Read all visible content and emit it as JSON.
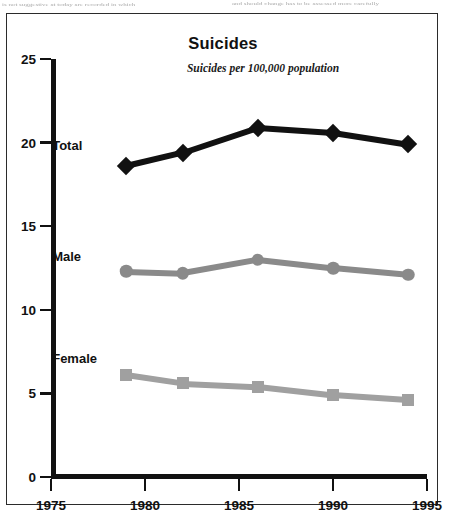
{
  "scan_text": {
    "left_fragment": "is not suggestive at today are recorded in which",
    "right_fragment": "and should change has to be assessed more carefully"
  },
  "chart_data": {
    "type": "line",
    "title": "Suicides",
    "subtitle": "Suicides per 100,000 population",
    "xlabel": "",
    "ylabel": "",
    "xlim": [
      1975,
      1995
    ],
    "ylim": [
      0,
      25
    ],
    "grid": false,
    "legend_position": "inline-left-of-series",
    "x_ticks": [
      "1975",
      "1980",
      "1985",
      "1990",
      "1995"
    ],
    "x_tick_values": [
      1975,
      1980,
      1985,
      1990,
      1995
    ],
    "y_ticks": [
      "0",
      "5",
      "10",
      "15",
      "20",
      "25"
    ],
    "y_tick_values": [
      0,
      5,
      10,
      15,
      20,
      25
    ],
    "x": [
      1979,
      1982,
      1986,
      1990,
      1994
    ],
    "series": [
      {
        "name": "Total",
        "marker": "diamond",
        "color": "#111111",
        "values": [
          18.6,
          19.4,
          20.9,
          20.6,
          19.9
        ]
      },
      {
        "name": "Male",
        "marker": "circle",
        "color": "#8a8a8a",
        "values": [
          12.3,
          12.2,
          13.0,
          12.5,
          12.1
        ]
      },
      {
        "name": "Female",
        "marker": "square",
        "color": "#a0a0a0",
        "values": [
          6.1,
          5.6,
          5.4,
          4.9,
          4.6
        ]
      }
    ],
    "series_labels": [
      {
        "text": "Total",
        "for": "Total"
      },
      {
        "text": "Male",
        "for": "Male"
      },
      {
        "text": "Female",
        "for": "Female"
      }
    ]
  }
}
